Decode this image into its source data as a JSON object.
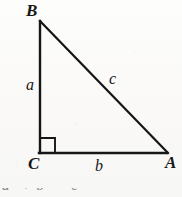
{
  "figure": {
    "type": "right-triangle-diagram",
    "background_color": "#fbfbfa",
    "stroke_color": "#161616",
    "vertices": {
      "B": {
        "label": "B",
        "x": 40,
        "y": 21
      },
      "C": {
        "label": "C",
        "x": 40,
        "y": 153
      },
      "A": {
        "label": "A",
        "x": 167,
        "y": 153
      }
    },
    "sides": {
      "a": {
        "label": "a",
        "from": "B",
        "to": "C",
        "description": "vertical leg"
      },
      "b": {
        "label": "b",
        "from": "C",
        "to": "A",
        "description": "horizontal leg"
      },
      "c": {
        "label": "c",
        "from": "B",
        "to": "A",
        "description": "hypotenuse"
      }
    },
    "right_angle": {
      "at_vertex": "C",
      "marker": "square",
      "marker_size": 15
    },
    "caption": "a² + b² = c²"
  }
}
